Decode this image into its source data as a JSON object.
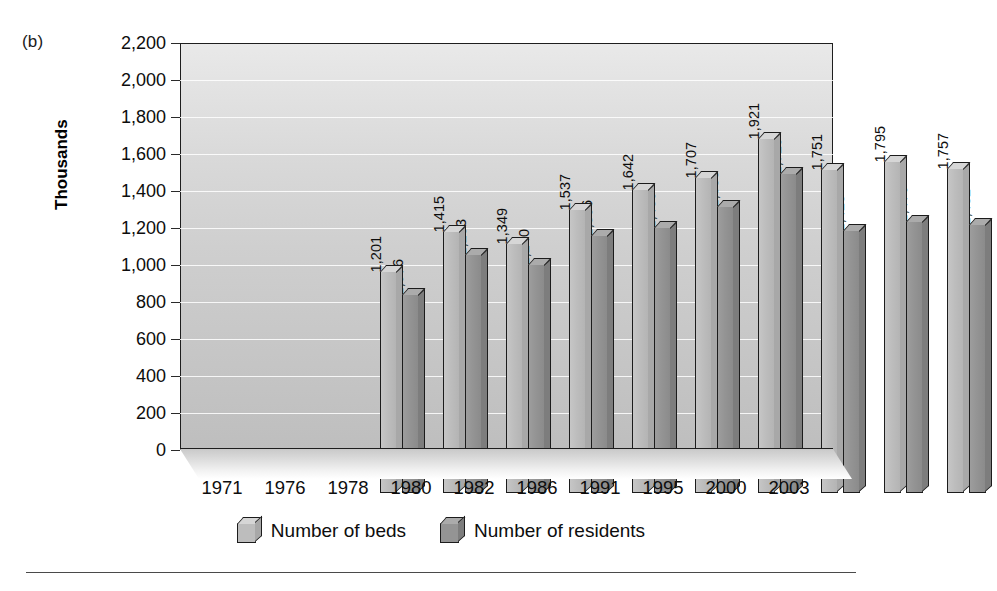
{
  "panel": {
    "label": "(b)"
  },
  "chart_data": {
    "type": "bar",
    "title": "",
    "subtitle": "",
    "xlabel": "",
    "ylabel": "Thousands",
    "ylim": [
      0,
      2200
    ],
    "ytick_step": 200,
    "ytick_labels": [
      "2,200",
      "2,000",
      "1,800",
      "1,600",
      "1,400",
      "1,200",
      "1,000",
      "800",
      "600",
      "400",
      "200",
      "0"
    ],
    "ytick_values": [
      2200,
      2000,
      1800,
      1600,
      1400,
      1200,
      1000,
      800,
      600,
      400,
      200,
      0
    ],
    "grid": true,
    "grid_orientation": "horizontal",
    "legend_position": "bottom-center",
    "categories": [
      "1971",
      "1976",
      "1978",
      "1980",
      "1982",
      "1986",
      "1991",
      "1995",
      "2000",
      "2003"
    ],
    "series": [
      {
        "name": "Number of beds",
        "color": "#bdbdbd",
        "values": [
          1201,
          1415,
          1349,
          1537,
          1642,
          1707,
          1921,
          1751,
          1795,
          1757
        ],
        "labels": [
          "1,201",
          "1,415",
          "1,349",
          "1,537",
          "1,642",
          "1,707",
          "1,921",
          "1,751",
          "1,795",
          "1,757"
        ]
      },
      {
        "name": "Number of residents",
        "color": "#949494",
        "values": [
          1076,
          1293,
          1240,
          1396,
          1439,
          1553,
          1729,
          1423,
          1470,
          1452
        ],
        "labels": [
          "1,076",
          "1,293",
          "1,240",
          "1,396",
          "1,439",
          "1,553",
          "1,729",
          "1,423",
          "1,470",
          "1,452"
        ]
      }
    ]
  },
  "legend": {
    "entries": [
      {
        "label": "Number of beds",
        "swatch": "beds"
      },
      {
        "label": "Number of residents",
        "swatch": "residents"
      }
    ]
  }
}
